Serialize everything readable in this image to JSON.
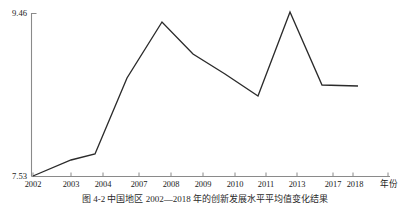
{
  "chart_data": {
    "type": "line",
    "title": "",
    "xlabel": "年份",
    "ylabel": "",
    "grid": false,
    "legend": "none",
    "xlim": [
      2002,
      2018
    ],
    "ylim": [
      7.53,
      9.46
    ],
    "y_tick_labels": [
      "7.53",
      "9.46"
    ],
    "y_ticks": [
      7.53,
      9.46
    ],
    "categories": [
      "2002",
      "2003",
      "2004",
      "2007",
      "2008",
      "2009",
      "2010",
      "2011",
      "2013",
      "2017",
      "2018"
    ],
    "x_tick_labels": [
      "2002",
      "2003",
      "2004",
      "2007",
      "2008",
      "2009",
      "2010",
      "2011",
      "2013",
      "2017",
      "2018"
    ],
    "series": [
      {
        "name": "",
        "values": [
          7.53,
          7.72,
          7.79,
          8.72,
          9.35,
          9.02,
          8.79,
          8.6,
          9.46,
          8.75,
          8.74
        ]
      }
    ],
    "points": [
      {
        "x": 2002,
        "y": 7.53,
        "px": 33,
        "py": 176
      },
      {
        "x": 2003,
        "y": 7.72,
        "px": 71,
        "py": 160
      },
      {
        "x": 2004,
        "y": 7.79,
        "px": 95,
        "py": 154
      },
      {
        "x": 2007,
        "y": 8.72,
        "px": 127,
        "py": 78
      },
      {
        "x": 2008,
        "y": 9.35,
        "px": 162,
        "py": 22
      },
      {
        "x": 2009,
        "y": 9.02,
        "px": 193,
        "py": 54
      },
      {
        "x": 2010,
        "y": 8.79,
        "px": 225,
        "py": 74
      },
      {
        "x": 2011,
        "y": 8.6,
        "px": 258,
        "py": 96
      },
      {
        "x": 2013,
        "y": 9.46,
        "px": 290,
        "py": 12
      },
      {
        "x": 2017,
        "y": 8.75,
        "px": 322,
        "py": 85
      },
      {
        "x": 2018,
        "y": 8.74,
        "px": 358,
        "py": 86
      }
    ],
    "x_tick_positions": [
      33,
      71,
      103,
      139,
      171,
      203,
      235,
      266,
      297,
      333,
      353
    ],
    "series_color": "#2b2b2b",
    "axis_color": "#8a8a8a"
  },
  "caption": {
    "text": "图 4-2  中国地区 2002—2018 年的创新发展水平平均值变化结果"
  }
}
